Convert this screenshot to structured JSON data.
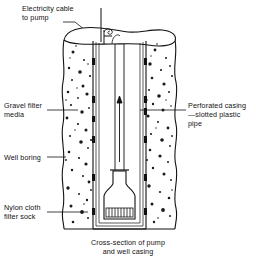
{
  "figure": {
    "title": "Cross-section of pump and well casing",
    "type": "engineering-cross-section"
  },
  "labels": {
    "cable": "Electricity cable\nto pump",
    "gravel": "Gravel filter\nmedia",
    "boring": "Well boring",
    "sock": "Nylon cloth\nfilter sock",
    "perforated": "Perforated casing\n—slotted plastic\npipe"
  },
  "caption": "Cross-section of pump\nand well casing",
  "colors": {
    "ink": "#111111",
    "paper": "#ffffff",
    "gravel_dot": "#1a1a1a",
    "slot": "#111111"
  },
  "diagram_elements": [
    {
      "name": "well-boring-wall-left",
      "kind": "wavy-vertical-line"
    },
    {
      "name": "well-boring-wall-right",
      "kind": "wavy-vertical-line"
    },
    {
      "name": "gravel-pack-left",
      "kind": "stippled-region"
    },
    {
      "name": "gravel-pack-right",
      "kind": "stippled-region"
    },
    {
      "name": "casing-wall-left",
      "kind": "double-line"
    },
    {
      "name": "casing-wall-right",
      "kind": "double-line"
    },
    {
      "name": "casing-slots",
      "kind": "dark-rectangles",
      "count": 12
    },
    {
      "name": "wellhead-ellipse",
      "kind": "open-top"
    },
    {
      "name": "electricity-cable",
      "kind": "vertical-line-with-hook"
    },
    {
      "name": "riser-pipe",
      "kind": "vertical-pipe"
    },
    {
      "name": "flow-arrow",
      "kind": "upward-arrow"
    },
    {
      "name": "pump-body",
      "kind": "flask-outline"
    },
    {
      "name": "pump-intake-screen",
      "kind": "hatched-band"
    },
    {
      "name": "well-bottom",
      "kind": "flat-base"
    }
  ]
}
